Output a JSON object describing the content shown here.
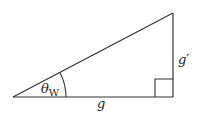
{
  "diagram": {
    "type": "right-triangle",
    "stroke_color": "#333333",
    "background": "#ffffff",
    "labels": {
      "angle": "θ",
      "angle_subscript": "W",
      "base": "g",
      "height": "g′"
    },
    "vertices": {
      "left": [
        13,
        97
      ],
      "right_angle": [
        173,
        97
      ],
      "top": [
        173,
        13
      ]
    }
  }
}
